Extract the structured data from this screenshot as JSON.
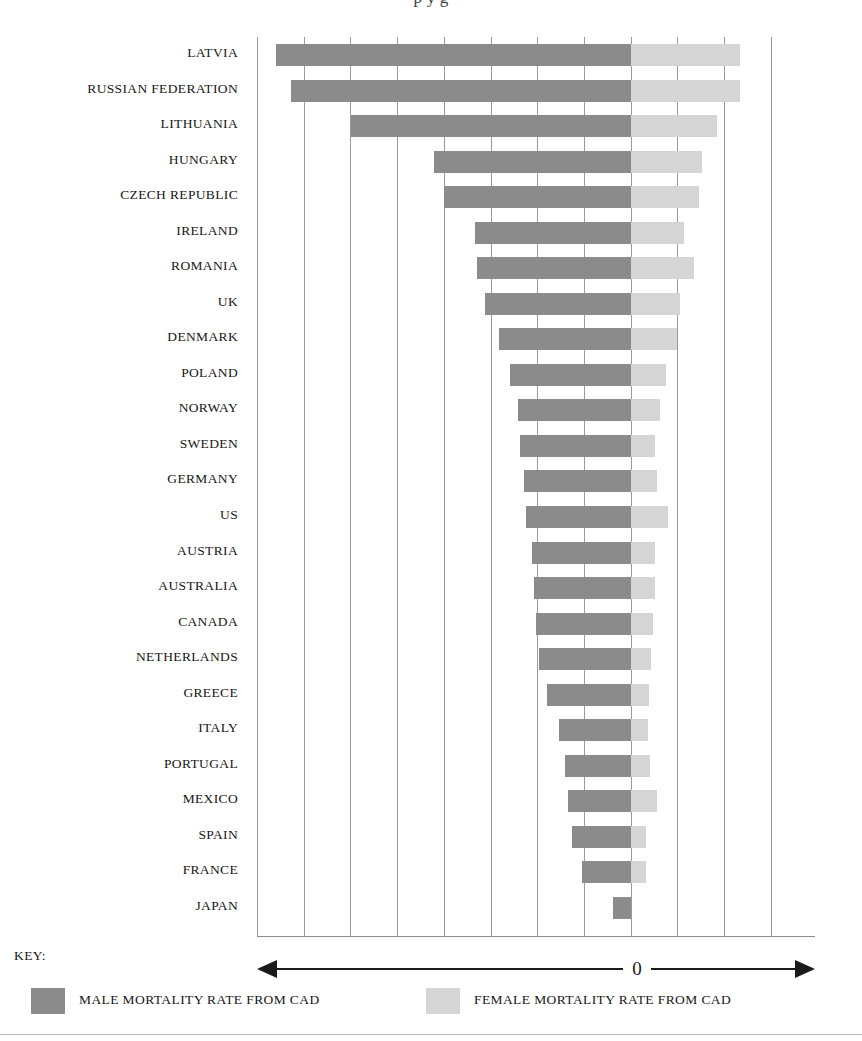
{
  "title_partial": "p    y g",
  "key": {
    "label": "KEY:",
    "zero_label": "0",
    "male_legend": "MALE MORTALITY RATE FROM CAD",
    "female_legend": "FEMALE MORTALITY RATE FROM CAD",
    "left_arrow_icon": "arrow-left-icon",
    "right_arrow_icon": "arrow-right-icon"
  },
  "colors": {
    "male": "#8b8b8b",
    "female": "#d5d5d5",
    "gridline": "#9a9a9a",
    "text": "#161616"
  },
  "chart_data": {
    "type": "bar",
    "orientation": "horizontal-diverging",
    "xlabel": "",
    "ylabel": "",
    "grid": true,
    "legend_position": "bottom",
    "axis_center_label": "0",
    "x_units": "relative mortality rate (gridline units, 1 unit ≈ 1 gridline)",
    "xlim": [
      -8.0,
      3.92
    ],
    "gridline_step": 1,
    "categories": [
      "LATVIA",
      "RUSSIAN FEDERATION",
      "LITHUANIA",
      "HUNGARY",
      "CZECH REPUBLIC",
      "IRELAND",
      "ROMANIA",
      "UK",
      "DENMARK",
      "POLAND",
      "NORWAY",
      "SWEDEN",
      "GERMANY",
      "US",
      "AUSTRIA",
      "AUSTRALIA",
      "CANADA",
      "NETHERLANDS",
      "GREECE",
      "ITALY",
      "PORTUGAL",
      "MEXICO",
      "SPAIN",
      "FRANCE",
      "JAPAN"
    ],
    "series": [
      {
        "name": "MALE MORTALITY RATE FROM CAD",
        "color": "#8b8b8b",
        "direction": "left",
        "values": [
          7.61,
          7.29,
          6.0,
          4.22,
          4.0,
          3.33,
          3.29,
          3.12,
          2.83,
          2.6,
          2.41,
          2.37,
          2.3,
          2.24,
          2.13,
          2.07,
          2.04,
          1.96,
          1.8,
          1.54,
          1.41,
          1.35,
          1.26,
          1.04,
          0.38
        ]
      },
      {
        "name": "FEMALE MORTALITY RATE FROM CAD",
        "color": "#d5d5d5",
        "direction": "right",
        "values": [
          2.34,
          2.34,
          1.84,
          1.52,
          1.46,
          1.13,
          1.35,
          1.04,
          0.99,
          0.74,
          0.63,
          0.52,
          0.56,
          0.8,
          0.52,
          0.52,
          0.48,
          0.43,
          0.39,
          0.37,
          0.41,
          0.56,
          0.33,
          0.33,
          0.0
        ]
      }
    ]
  }
}
